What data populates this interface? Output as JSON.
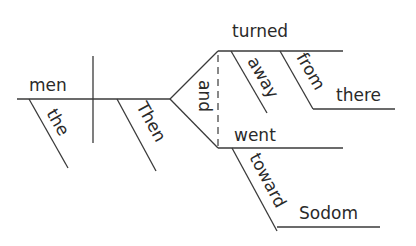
{
  "diagram": {
    "type": "sentence-diagram",
    "sentence": "Then the men turned away from there and went toward Sodom",
    "subject": {
      "word": "men",
      "modifiers": [
        "the"
      ]
    },
    "predicate": {
      "adverb_modifier": "Then",
      "conjunction": "and",
      "verbs": [
        {
          "word": "turned",
          "modifiers": [
            "away"
          ],
          "prepositional_phrase": {
            "preposition": "from",
            "object": "there"
          }
        },
        {
          "word": "went",
          "prepositional_phrase": {
            "preposition": "toward",
            "object": "Sodom"
          }
        }
      ]
    }
  },
  "labels": {
    "men": "men",
    "the": "the",
    "then": "Then",
    "and": "and",
    "turned": "turned",
    "away": "away",
    "from": "from",
    "there": "there",
    "went": "went",
    "toward": "toward",
    "sodom": "Sodom"
  },
  "colors": {
    "line": "#3a3a3a",
    "text": "#2a2a2a",
    "background": "#ffffff"
  }
}
